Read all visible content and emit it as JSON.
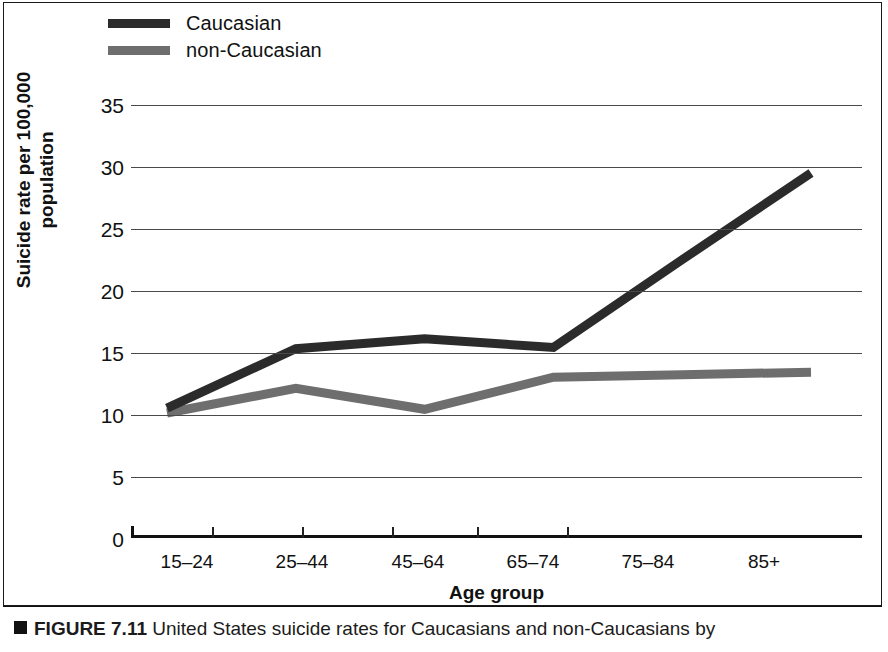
{
  "figure": {
    "caption_marker": "square-bullet",
    "caption_strong": "FIGURE 7.11",
    "caption_text": "United States suicide rates for Caucasians and non-Caucasians by"
  },
  "legend": {
    "items": [
      {
        "label": "Caucasian",
        "color": "#2b2b2b"
      },
      {
        "label": "non-Caucasian",
        "color": "#6e6e6e"
      }
    ]
  },
  "axes": {
    "y_title_line1": "Suicide rate per 100,000",
    "y_title_line2": "population",
    "x_title": "Age group",
    "y_ticks": [
      "0",
      "5",
      "10",
      "15",
      "20",
      "25",
      "30",
      "35"
    ],
    "x_ticks": [
      "15–24",
      "25–44",
      "45–64",
      "65–74",
      "75–84",
      "85+"
    ]
  },
  "chart_data": {
    "type": "line",
    "xlabel": "Age group",
    "ylabel": "Suicide rate per 100,000 population",
    "categories": [
      "15–24",
      "25–44",
      "45–64",
      "65–74",
      "75–84",
      "85+"
    ],
    "series": [
      {
        "name": "Caucasian",
        "color": "#2b2b2b",
        "values": [
          10.5,
          15.3,
          16.1,
          15.4,
          22.5,
          29.5
        ]
      },
      {
        "name": "non-Caucasian",
        "color": "#6e6e6e",
        "values": [
          10.1,
          12.1,
          10.4,
          13.0,
          13.2,
          13.4
        ]
      }
    ],
    "ylim": [
      0,
      35
    ],
    "ytick_step": 5,
    "grid": true,
    "legend_position": "top-left"
  }
}
